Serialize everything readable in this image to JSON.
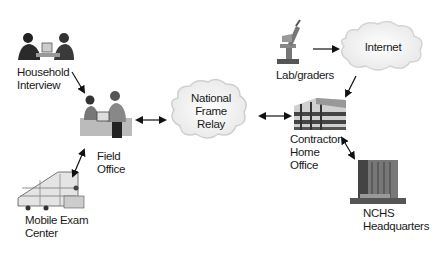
{
  "diagram": {
    "nodes": [
      {
        "id": "household",
        "label_lines": [
          "Household",
          "Interview"
        ],
        "icon": "people-at-computer-icon"
      },
      {
        "id": "field",
        "label_lines": [
          "Field",
          "Office"
        ],
        "icon": "office-workers-icon"
      },
      {
        "id": "mobile",
        "label_lines": [
          "Mobile Exam",
          "Center"
        ],
        "icon": "trailer-icon"
      },
      {
        "id": "relay",
        "label_lines": [
          "National",
          "Frame",
          "Relay"
        ],
        "icon": "cloud-icon"
      },
      {
        "id": "lab",
        "label_lines": [
          "Lab/graders"
        ],
        "icon": "microscope-icon"
      },
      {
        "id": "internet",
        "label_lines": [
          "Internet"
        ],
        "icon": "cloud-icon"
      },
      {
        "id": "contractor",
        "label_lines": [
          "Contractor",
          "Home",
          "Office"
        ],
        "icon": "office-building-icon"
      },
      {
        "id": "nchs",
        "label_lines": [
          "NCHS",
          "Headquarters"
        ],
        "icon": "tower-building-icon"
      }
    ],
    "edges": [
      {
        "from": "household",
        "to": "field",
        "direction": "one-way"
      },
      {
        "from": "field",
        "to": "mobile",
        "direction": "two-way"
      },
      {
        "from": "field",
        "to": "relay",
        "direction": "two-way"
      },
      {
        "from": "relay",
        "to": "contractor",
        "direction": "two-way"
      },
      {
        "from": "lab",
        "to": "internet",
        "direction": "one-way"
      },
      {
        "from": "internet",
        "to": "contractor",
        "direction": "one-way"
      },
      {
        "from": "contractor",
        "to": "nchs",
        "direction": "two-way"
      }
    ],
    "labels": {
      "household_1": "Household",
      "household_2": "Interview",
      "field_1": "Field",
      "field_2": "Office",
      "mobile_1": "Mobile Exam",
      "mobile_2": "Center",
      "relay_1": "National",
      "relay_2": "Frame",
      "relay_3": "Relay",
      "lab_1": "Lab/graders",
      "internet_1": "Internet",
      "contractor_1": "Contractor",
      "contractor_2": "Home",
      "contractor_3": "Office",
      "nchs_1": "NCHS",
      "nchs_2": "Headquarters"
    }
  }
}
